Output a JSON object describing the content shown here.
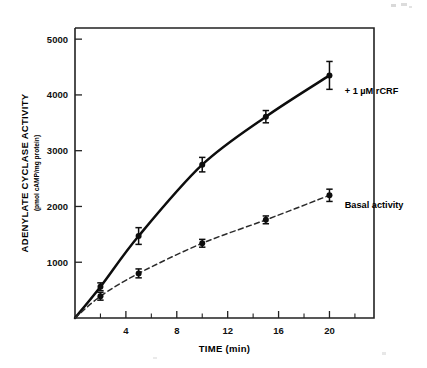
{
  "figure": {
    "background_color": "#ffffff",
    "ink_color": "#0d0d0d"
  },
  "chart_data": {
    "type": "line",
    "title": "",
    "subtitle": "",
    "xlabel": "TIME (min)",
    "ylabel": "ADENYLATE CYCLASE ACTIVITY",
    "ylabel_units": "(pmol cAMP/mg protein)",
    "xlim": [
      0,
      23.5
    ],
    "ylim": [
      0,
      5200
    ],
    "xticks": [
      4,
      8,
      12,
      16,
      20
    ],
    "xtick_labels": [
      "4",
      "8",
      "12",
      "16",
      "20"
    ],
    "xticks_minor": [
      2,
      6,
      10,
      14,
      18,
      22
    ],
    "yticks": [
      1000,
      2000,
      3000,
      4000,
      5000
    ],
    "ytick_labels": [
      "1000",
      "2000",
      "3000",
      "4000",
      "5000"
    ],
    "grid": false,
    "legend_position": "inline-annotation",
    "series": [
      {
        "name": "+ 1 µM rCRF",
        "label": "+ 1 µM rCRF",
        "style": "solid",
        "marker": "filled-circle",
        "color": "#0d0d0d",
        "x": [
          0,
          2,
          5,
          10,
          15,
          20
        ],
        "values": [
          0,
          560,
          1470,
          2750,
          3610,
          4350
        ],
        "errors": [
          0,
          70,
          150,
          130,
          110,
          250
        ],
        "label_x": 21.2,
        "label_y": 4020
      },
      {
        "name": "Basal activity",
        "label": "Basal activity",
        "style": "dashed",
        "marker": "filled-circle",
        "color": "#2b2b2b",
        "x": [
          0,
          2,
          5,
          10,
          15,
          20
        ],
        "values": [
          0,
          390,
          800,
          1340,
          1760,
          2200
        ],
        "errors": [
          0,
          70,
          80,
          70,
          70,
          110
        ],
        "label_x": 21.2,
        "label_y": 1980
      }
    ]
  },
  "annotations": [
    {
      "name": "rcrf-series-label",
      "text": "+ 1 µM rCRF"
    },
    {
      "name": "basal-series-label",
      "text": "Basal activity"
    }
  ]
}
